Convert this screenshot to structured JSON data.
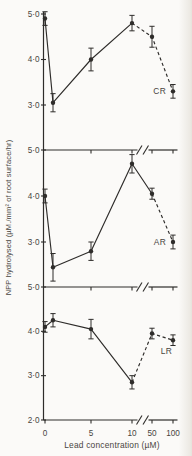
{
  "colors": {
    "background": "#fbfaf8",
    "ink": "#2e2c2a",
    "text": "#49453f"
  },
  "chart_data": {
    "type": "line",
    "title": "",
    "xlabel": "Lead concentration (µM)",
    "ylabel": "NPP hydrolysed (µM./mm² of root surface/hr)",
    "x_tick_labels": [
      "0",
      "5",
      "10",
      "50",
      "100"
    ],
    "x_tick_values": [
      0,
      5,
      10,
      50,
      100
    ],
    "x_axis_break_between": [
      10,
      50
    ],
    "grid": "off",
    "marker": "filled-circle",
    "error_bars": "vertical-with-caps",
    "panels": [
      {
        "label": "CR",
        "y_tick_labels": [
          "5·0",
          "4·0",
          "3·0"
        ],
        "y_tick_values": [
          5,
          4,
          3
        ],
        "ylim": [
          2,
          5.2
        ],
        "series": {
          "x": [
            0,
            1,
            5,
            10,
            50,
            100
          ],
          "y": [
            4.9,
            3.05,
            4.0,
            4.8,
            4.5,
            3.3
          ],
          "yerr": [
            0.15,
            0.2,
            0.25,
            0.17,
            0.23,
            0.15
          ],
          "dashed_after_x": 10
        }
      },
      {
        "label": "AR",
        "y_tick_labels": [
          "5·0",
          "4·0",
          "3·0"
        ],
        "y_tick_values": [
          5,
          4,
          3
        ],
        "ylim": [
          2,
          5
        ],
        "series": {
          "x": [
            0,
            1,
            5,
            10,
            50,
            100
          ],
          "y": [
            4.0,
            2.45,
            2.8,
            4.7,
            4.05,
            3.0
          ],
          "yerr": [
            0.15,
            0.3,
            0.2,
            0.2,
            0.12,
            0.15
          ],
          "dashed_after_x": 50
        }
      },
      {
        "label": "LR",
        "y_tick_labels": [
          "5·0",
          "4·0",
          "3·0",
          "2·0"
        ],
        "y_tick_values": [
          5,
          4,
          3,
          2
        ],
        "ylim": [
          2,
          5
        ],
        "series": {
          "x": [
            0,
            1,
            5,
            10,
            50,
            100
          ],
          "y": [
            4.1,
            4.25,
            4.05,
            2.85,
            3.95,
            3.8
          ],
          "yerr": [
            0.12,
            0.15,
            0.22,
            0.15,
            0.12,
            0.12
          ],
          "dashed_after_x": 10
        }
      }
    ]
  }
}
